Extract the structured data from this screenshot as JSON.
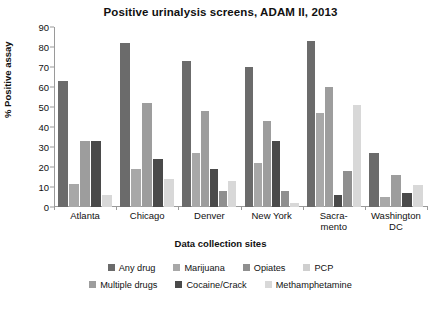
{
  "chart_data": {
    "type": "bar",
    "title": "Positive urinalysis screens, ADAM II, 2013",
    "xlabel": "Data collection sites",
    "ylabel": "% Positive assay",
    "ylim": [
      0,
      90
    ],
    "yticks": [
      0,
      10,
      20,
      30,
      40,
      50,
      60,
      70,
      80,
      90
    ],
    "grid": false,
    "legend_position": "bottom",
    "categories": [
      "Atlanta",
      "Chicago",
      "Denver",
      "New York",
      "Sacramento",
      "Washington DC"
    ],
    "category_lines": [
      [
        "Atlanta"
      ],
      [
        "Chicago"
      ],
      [
        "Denver"
      ],
      [
        "New York"
      ],
      [
        "Sacra-",
        "mento"
      ],
      [
        "Washington",
        "DC"
      ]
    ],
    "series": [
      {
        "name": "Any drug",
        "color": "#6b6b6b",
        "values": [
          63,
          82,
          73,
          70,
          83,
          27
        ]
      },
      {
        "name": "Marijuana",
        "color": "#a8a8a8",
        "values": [
          11.5,
          19,
          27,
          22,
          47,
          5
        ]
      },
      {
        "name": "Opiates",
        "color": "#8f8f8f",
        "values": [
          0,
          0,
          0,
          0,
          0,
          0
        ]
      },
      {
        "name": "PCP",
        "color": "#cfcfcf",
        "values": [
          0,
          0,
          0,
          0,
          0,
          0
        ]
      },
      {
        "name": "Multiple drugs",
        "color": "#9d9d9d",
        "values": [
          33,
          52,
          48,
          43,
          60,
          16
        ]
      },
      {
        "name": "Cocaine/Crack",
        "color": "#4a4a4a",
        "values": [
          33,
          24,
          19,
          33,
          6,
          16
        ]
      },
      {
        "name": "Methamphetamine",
        "color": "#d8d8d8",
        "values": [
          6,
          14,
          8,
          2,
          18,
          11
        ]
      }
    ],
    "groups": [
      {
        "category": "Atlanta",
        "bars": [
          {
            "series": "Any drug",
            "value": 63,
            "color": "#6b6b6b"
          },
          {
            "series": "Marijuana",
            "value": 11.5,
            "color": "#a8a8a8"
          },
          {
            "series": "Multiple drugs",
            "value": 33,
            "color": "#9d9d9d"
          },
          {
            "series": "Cocaine/Crack",
            "value": 33,
            "color": "#4a4a4a"
          },
          {
            "series": "Methamphetamine",
            "value": 6,
            "color": "#d8d8d8"
          }
        ]
      },
      {
        "category": "Chicago",
        "bars": [
          {
            "series": "Any drug",
            "value": 82,
            "color": "#6b6b6b"
          },
          {
            "series": "Marijuana",
            "value": 19,
            "color": "#a8a8a8"
          },
          {
            "series": "Multiple drugs",
            "value": 52,
            "color": "#9d9d9d"
          },
          {
            "series": "Cocaine/Crack",
            "value": 24,
            "color": "#4a4a4a"
          },
          {
            "series": "Methamphetamine",
            "value": 14,
            "color": "#d8d8d8"
          }
        ]
      },
      {
        "category": "Denver",
        "bars": [
          {
            "series": "Any drug",
            "value": 73,
            "color": "#6b6b6b"
          },
          {
            "series": "Marijuana",
            "value": 27,
            "color": "#a8a8a8"
          },
          {
            "series": "Multiple drugs",
            "value": 48,
            "color": "#9d9d9d"
          },
          {
            "series": "Cocaine/Crack",
            "value": 19,
            "color": "#4a4a4a"
          },
          {
            "series": "Opiates",
            "value": 8,
            "color": "#8f8f8f"
          },
          {
            "series": "Methamphetamine",
            "value": 13,
            "color": "#d8d8d8"
          }
        ]
      },
      {
        "category": "New York",
        "bars": [
          {
            "series": "Any drug",
            "value": 70,
            "color": "#6b6b6b"
          },
          {
            "series": "Marijuana",
            "value": 22,
            "color": "#a8a8a8"
          },
          {
            "series": "Multiple drugs",
            "value": 43,
            "color": "#9d9d9d"
          },
          {
            "series": "Cocaine/Crack",
            "value": 33,
            "color": "#4a4a4a"
          },
          {
            "series": "Opiates",
            "value": 8,
            "color": "#8f8f8f"
          },
          {
            "series": "Methamphetamine",
            "value": 2,
            "color": "#d8d8d8"
          }
        ]
      },
      {
        "category": "Sacramento",
        "bars": [
          {
            "series": "Any drug",
            "value": 83,
            "color": "#6b6b6b"
          },
          {
            "series": "Marijuana",
            "value": 47,
            "color": "#a8a8a8"
          },
          {
            "series": "Multiple drugs",
            "value": 60,
            "color": "#9d9d9d"
          },
          {
            "series": "Cocaine/Crack",
            "value": 6,
            "color": "#4a4a4a"
          },
          {
            "series": "Opiates",
            "value": 18,
            "color": "#8f8f8f"
          },
          {
            "series": "Methamphetamine",
            "value": 51,
            "color": "#d8d8d8"
          }
        ]
      },
      {
        "category": "Washington DC",
        "bars": [
          {
            "series": "Any drug",
            "value": 27,
            "color": "#6b6b6b"
          },
          {
            "series": "Marijuana",
            "value": 5,
            "color": "#a8a8a8"
          },
          {
            "series": "Multiple drugs",
            "value": 16,
            "color": "#9d9d9d"
          },
          {
            "series": "Cocaine/Crack",
            "value": 7,
            "color": "#4a4a4a"
          },
          {
            "series": "Methamphetamine",
            "value": 11,
            "color": "#d8d8d8"
          }
        ]
      }
    ],
    "legend": [
      {
        "label": "Any drug",
        "color": "#6b6b6b"
      },
      {
        "label": "Marijuana",
        "color": "#a8a8a8"
      },
      {
        "label": "Opiates",
        "color": "#8f8f8f"
      },
      {
        "label": "PCP",
        "color": "#cfcfcf"
      },
      {
        "label": "Multiple drugs",
        "color": "#9d9d9d"
      },
      {
        "label": "Cocaine/Crack",
        "color": "#4a4a4a"
      },
      {
        "label": "Methamphetamine",
        "color": "#d8d8d8"
      }
    ],
    "legend_rows": [
      [
        "Any drug",
        "Marijuana",
        "Opiates",
        "PCP"
      ],
      [
        "Multiple drugs",
        "Cocaine/Crack",
        "Methamphetamine"
      ]
    ]
  }
}
